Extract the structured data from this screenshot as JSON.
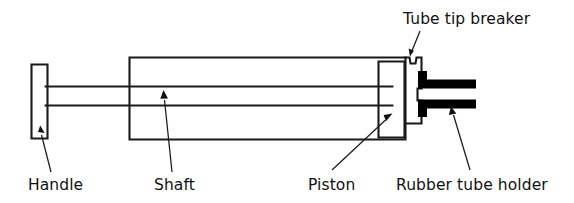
{
  "diagram": {
    "background_color": "#ffffff",
    "line_color": "#1a1a1a",
    "fill_color": "#000000",
    "labels": {
      "tube_tip_breaker": "Tube tip breaker",
      "handle": "Handle",
      "shaft": "Shaft",
      "piston": "Piston",
      "rubber_tube_holder": "Rubber tube holder"
    },
    "parts": [
      {
        "name": "handle",
        "label": "Handle",
        "shape": "vertical-bar"
      },
      {
        "name": "shaft",
        "label": "Shaft",
        "shape": "horizontal-rod"
      },
      {
        "name": "barrel",
        "label": "",
        "shape": "rectangle"
      },
      {
        "name": "piston",
        "label": "Piston",
        "shape": "rectangle"
      },
      {
        "name": "tube-tip-breaker",
        "label": "Tube tip breaker",
        "shape": "notch"
      },
      {
        "name": "rubber-tube-holder",
        "label": "Rubber tube holder",
        "shape": "jaw-bars"
      }
    ]
  }
}
